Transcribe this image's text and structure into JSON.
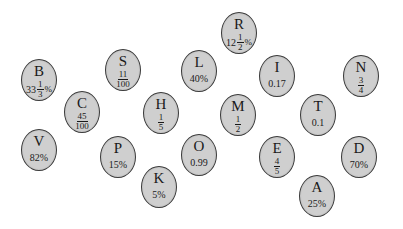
{
  "bubbles": [
    {
      "letter": "B",
      "kind": "mixed-percent",
      "whole": "33",
      "num": "1",
      "den": "3",
      "suffix": "%",
      "x": 39,
      "y": 80
    },
    {
      "letter": "S",
      "kind": "fraction",
      "num": "11",
      "den": "100",
      "x": 123,
      "y": 70
    },
    {
      "letter": "L",
      "kind": "text",
      "text": "40%",
      "x": 199,
      "y": 71
    },
    {
      "letter": "R",
      "kind": "mixed-percent",
      "whole": "12",
      "num": "1",
      "den": "2",
      "suffix": "%",
      "x": 239,
      "y": 33
    },
    {
      "letter": "I",
      "kind": "text",
      "text": "0.17",
      "x": 277,
      "y": 76
    },
    {
      "letter": "N",
      "kind": "fraction",
      "num": "3",
      "den": "4",
      "x": 361,
      "y": 76
    },
    {
      "letter": "C",
      "kind": "fraction",
      "num": "45",
      "den": "100",
      "x": 82,
      "y": 112
    },
    {
      "letter": "H",
      "kind": "fraction",
      "num": "1",
      "den": "5",
      "x": 161,
      "y": 113
    },
    {
      "letter": "M",
      "kind": "fraction",
      "num": "1",
      "den": "2",
      "x": 238,
      "y": 115
    },
    {
      "letter": "T",
      "kind": "text",
      "text": "0.1",
      "x": 318,
      "y": 115
    },
    {
      "letter": "V",
      "kind": "text",
      "text": "82%",
      "x": 39,
      "y": 150
    },
    {
      "letter": "P",
      "kind": "text",
      "text": "15%",
      "x": 118,
      "y": 157
    },
    {
      "letter": "O",
      "kind": "text",
      "text": "0.99",
      "x": 199,
      "y": 155
    },
    {
      "letter": "E",
      "kind": "fraction",
      "num": "4",
      "den": "5",
      "x": 277,
      "y": 157
    },
    {
      "letter": "D",
      "kind": "text",
      "text": "70%",
      "x": 359,
      "y": 157
    },
    {
      "letter": "K",
      "kind": "text",
      "text": "5%",
      "x": 159,
      "y": 187
    },
    {
      "letter": "A",
      "kind": "text",
      "text": "25%",
      "x": 317,
      "y": 196
    }
  ],
  "colors": {
    "bubble_fill": "#cfcfcf",
    "bubble_border": "#3a3a3a",
    "text": "#1a1a1a",
    "background": "#ffffff"
  }
}
